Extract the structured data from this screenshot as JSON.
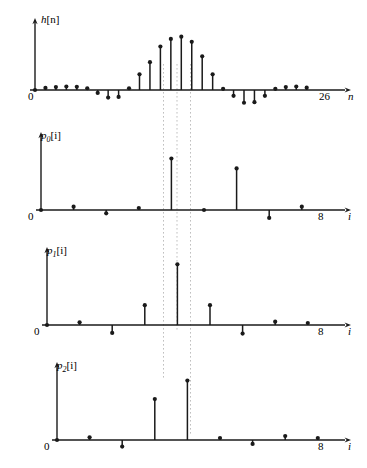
{
  "figure": {
    "type": "stem-plot-panel-set",
    "background": "#ffffff",
    "ink_color": "#1a1a1a",
    "guide_color": "#bfbfbf",
    "panel_count": 4
  },
  "chart_data": [
    {
      "type": "line",
      "subtype": "stem",
      "panel_index": 0,
      "title": "",
      "ylabel": "h[n]",
      "xlabel": "n",
      "xlim": [
        0,
        27.5
      ],
      "ylim": [
        -0.38,
        1.05
      ],
      "grid": false,
      "legend": null,
      "x_tick_labels": [
        {
          "value": 0,
          "text": "0"
        },
        {
          "value": 26,
          "text": "26"
        }
      ],
      "x": [
        0,
        1,
        2,
        3,
        4,
        5,
        6,
        7,
        8,
        9,
        10,
        11,
        12,
        13,
        14,
        15,
        16,
        17,
        18,
        19,
        20,
        21,
        22,
        23,
        24,
        25,
        26
      ],
      "values": [
        0.0,
        0.035,
        0.05,
        0.06,
        0.055,
        0.03,
        -0.05,
        -0.13,
        -0.12,
        0.03,
        0.27,
        0.48,
        0.75,
        0.88,
        0.92,
        0.83,
        0.58,
        0.27,
        0.02,
        -0.1,
        -0.22,
        -0.21,
        -0.1,
        0.02,
        0.05,
        0.06,
        0.04
      ]
    },
    {
      "type": "line",
      "subtype": "stem",
      "panel_index": 1,
      "title": "",
      "ylabel": "p0[i]",
      "ylabel_base": "p",
      "ylabel_sub": "0",
      "ylabel_arg": "[i]",
      "xlabel": "i",
      "xlim": [
        0,
        9.3
      ],
      "ylim": [
        -0.33,
        1.05
      ],
      "grid": false,
      "legend": null,
      "x_tick_labels": [
        {
          "value": 0,
          "text": "0"
        },
        {
          "value": 8,
          "text": "8"
        }
      ],
      "x": [
        0,
        1,
        2,
        3,
        4,
        5,
        6,
        7,
        8
      ],
      "values": [
        0.0,
        0.05,
        -0.05,
        0.03,
        0.78,
        0.0,
        0.63,
        -0.12,
        0.05
      ]
    },
    {
      "type": "line",
      "subtype": "stem",
      "panel_index": 2,
      "title": "",
      "ylabel": "p1[i]",
      "ylabel_base": "p",
      "ylabel_sub": "1",
      "ylabel_arg": "[i]",
      "xlabel": "i",
      "xlim": [
        0,
        9.3
      ],
      "ylim": [
        -0.33,
        1.05
      ],
      "grid": false,
      "legend": null,
      "x_tick_labels": [
        {
          "value": 0,
          "text": "0"
        },
        {
          "value": 8,
          "text": "8"
        }
      ],
      "x": [
        0,
        1,
        2,
        3,
        4,
        5,
        6,
        7,
        8
      ],
      "values": [
        0.0,
        0.04,
        -0.12,
        0.3,
        0.92,
        0.3,
        -0.13,
        0.05,
        0.03
      ]
    },
    {
      "type": "line",
      "subtype": "stem",
      "panel_index": 3,
      "title": "",
      "ylabel": "p2[i]",
      "ylabel_base": "p",
      "ylabel_sub": "2",
      "ylabel_arg": "[i]",
      "xlabel": "i",
      "xlim": [
        0,
        9.3
      ],
      "ylim": [
        -0.33,
        1.05
      ],
      "grid": false,
      "legend": null,
      "x_tick_labels": [
        {
          "value": 0,
          "text": "0"
        },
        {
          "value": 8,
          "text": "8"
        }
      ],
      "x": [
        0,
        1,
        2,
        3,
        4,
        5,
        6,
        7,
        8
      ],
      "values": [
        0.0,
        0.04,
        -0.1,
        0.62,
        0.9,
        0.03,
        -0.06,
        0.06,
        0.03
      ]
    }
  ],
  "guide_lines": {
    "description": "vertical dotted alignment guides",
    "x_positions_px": [
      163.5,
      177.0,
      190.5
    ],
    "spans": [
      {
        "from_y": 64,
        "to_y": 380
      },
      {
        "from_y": 64,
        "to_y": 330
      },
      {
        "from_y": 64,
        "to_y": 435
      }
    ]
  },
  "labels": {
    "panel0_ylabel_base": "h",
    "panel0_ylabel_arg": "[n]",
    "panel0_xlabel": "n",
    "panel0_origin": "0",
    "panel0_xmax": "26",
    "panel1_ylabel_base": "p",
    "panel1_ylabel_sub": "0",
    "panel1_ylabel_arg": "[i]",
    "panel1_xlabel": "i",
    "panel1_origin": "0",
    "panel1_xmax": "8",
    "panel2_ylabel_base": "p",
    "panel2_ylabel_sub": "1",
    "panel2_ylabel_arg": "[i]",
    "panel2_xlabel": "i",
    "panel2_origin": "0",
    "panel2_xmax": "8",
    "panel3_ylabel_base": "p",
    "panel3_ylabel_sub": "2",
    "panel3_ylabel_arg": "[i]",
    "panel3_xlabel": "i",
    "panel3_origin": "0",
    "panel3_xmax": "8"
  }
}
